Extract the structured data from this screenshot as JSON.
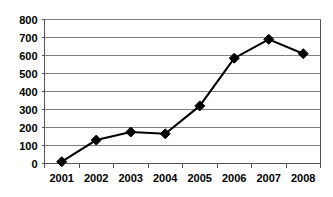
{
  "chart_data": {
    "type": "line",
    "title": "",
    "subtitle": "",
    "xlabel": "",
    "ylabel": "",
    "categories": [
      "2001",
      "2002",
      "2003",
      "2004",
      "2005",
      "2006",
      "2007",
      "2008"
    ],
    "values": [
      10,
      130,
      175,
      165,
      320,
      585,
      690,
      610
    ],
    "series": [
      {
        "name": "series-1",
        "values": [
          10,
          130,
          175,
          165,
          320,
          585,
          690,
          610
        ],
        "color": "#000000",
        "marker": "diamond"
      }
    ],
    "ylim": [
      0,
      800
    ],
    "ytick_step": 100,
    "ytick_labels": [
      "0",
      "100",
      "200",
      "300",
      "400",
      "500",
      "600",
      "700",
      "800"
    ],
    "xtick_labels": [
      "2001",
      "2002",
      "2003",
      "2004",
      "2005",
      "2006",
      "2007",
      "2008"
    ],
    "grid": true,
    "grid_axis": "y",
    "grid_color": "#808080",
    "legend": false,
    "legend_position": "none",
    "plot_background": "#ffffff",
    "frame": "left-right-bottom"
  },
  "axes": {
    "y_ticks": [
      {
        "label": "800",
        "value": 800
      },
      {
        "label": "700",
        "value": 700
      },
      {
        "label": "600",
        "value": 600
      },
      {
        "label": "500",
        "value": 500
      },
      {
        "label": "400",
        "value": 400
      },
      {
        "label": "300",
        "value": 300
      },
      {
        "label": "200",
        "value": 200
      },
      {
        "label": "100",
        "value": 100
      },
      {
        "label": "0",
        "value": 0
      }
    ],
    "x_ticks": [
      {
        "label": "2001"
      },
      {
        "label": "2002"
      },
      {
        "label": "2003"
      },
      {
        "label": "2004"
      },
      {
        "label": "2005"
      },
      {
        "label": "2006"
      },
      {
        "label": "2007"
      },
      {
        "label": "2008"
      }
    ]
  },
  "points": [
    {
      "category": "2001",
      "value": 10
    },
    {
      "category": "2002",
      "value": 130
    },
    {
      "category": "2003",
      "value": 175
    },
    {
      "category": "2004",
      "value": 165
    },
    {
      "category": "2005",
      "value": 320
    },
    {
      "category": "2006",
      "value": 585
    },
    {
      "category": "2007",
      "value": 690
    },
    {
      "category": "2008",
      "value": 610
    }
  ]
}
